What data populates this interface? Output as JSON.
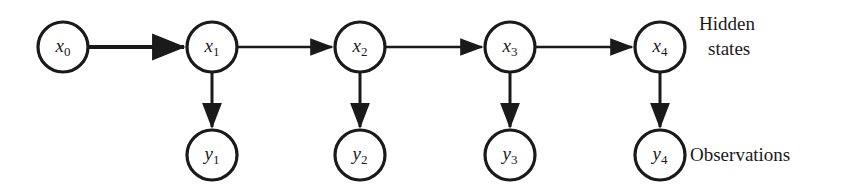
{
  "diagram": {
    "colors": {
      "background": "#ffffff",
      "stroke": "#1a1a1a",
      "node_fill": "#ffffff"
    },
    "hidden_states_label": {
      "line1": "Hidden",
      "line2": "states"
    },
    "observations_label": "Observations",
    "hidden_nodes": [
      {
        "id": "x0",
        "base": "x",
        "sub": "0",
        "cx": 63,
        "cy": 47,
        "r": 25
      },
      {
        "id": "x1",
        "base": "x",
        "sub": "1",
        "cx": 212,
        "cy": 47,
        "r": 25
      },
      {
        "id": "x2",
        "base": "x",
        "sub": "2",
        "cx": 360,
        "cy": 47,
        "r": 25
      },
      {
        "id": "x3",
        "base": "x",
        "sub": "3",
        "cx": 510,
        "cy": 47,
        "r": 25
      },
      {
        "id": "x4",
        "base": "x",
        "sub": "4",
        "cx": 660,
        "cy": 47,
        "r": 25
      }
    ],
    "observation_nodes": [
      {
        "id": "y1",
        "base": "y",
        "sub": "1",
        "cx": 212,
        "cy": 155,
        "r": 25
      },
      {
        "id": "y2",
        "base": "y",
        "sub": "2",
        "cx": 360,
        "cy": 155,
        "r": 25
      },
      {
        "id": "y3",
        "base": "y",
        "sub": "3",
        "cx": 510,
        "cy": 155,
        "r": 25
      },
      {
        "id": "y4",
        "base": "y",
        "sub": "4",
        "cx": 660,
        "cy": 155,
        "r": 25
      }
    ],
    "transition_edges": [
      {
        "id": "x0-x1",
        "from": "x0",
        "to": "x1",
        "x1": 89,
        "x2": 184,
        "y": 47,
        "weight": "thick"
      },
      {
        "id": "x1-x2",
        "from": "x1",
        "to": "x2",
        "x1": 238,
        "x2": 332,
        "y": 47,
        "weight": "thin"
      },
      {
        "id": "x2-x3",
        "from": "x2",
        "to": "x3",
        "x1": 386,
        "x2": 482,
        "y": 47,
        "weight": "thin"
      },
      {
        "id": "x3-x4",
        "from": "x3",
        "to": "x4",
        "x1": 536,
        "x2": 632,
        "y": 47,
        "weight": "thin"
      }
    ],
    "emission_edges": [
      {
        "id": "x1-y1",
        "from": "x1",
        "to": "y1",
        "x": 212,
        "y1": 73,
        "y2": 127
      },
      {
        "id": "x2-y2",
        "from": "x2",
        "to": "y2",
        "x": 360,
        "y1": 73,
        "y2": 127
      },
      {
        "id": "x3-y3",
        "from": "x3",
        "to": "y3",
        "x": 510,
        "y1": 73,
        "y2": 127
      },
      {
        "id": "x4-y4",
        "from": "x4",
        "to": "y4",
        "x": 660,
        "y1": 73,
        "y2": 127
      }
    ]
  }
}
